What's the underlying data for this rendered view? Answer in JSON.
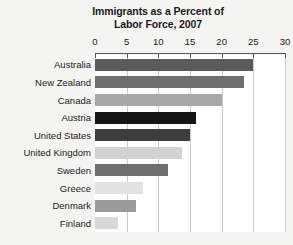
{
  "chart_data": {
    "type": "bar",
    "orientation": "horizontal",
    "title": "Immigrants as a Percent of Labor Force, 2007",
    "title_line1": "Immigrants as a Percent of",
    "title_line2": "Labor Force, 2007",
    "xlabel": "",
    "ylabel": "",
    "xlim": [
      0,
      30
    ],
    "xticks": [
      0,
      5,
      10,
      15,
      20,
      25,
      30
    ],
    "xtick_labels": [
      "0",
      "5",
      "10",
      "15",
      "20",
      "25",
      "30"
    ],
    "grid": "vertical",
    "legend": "none",
    "categories": [
      "Australia",
      "New Zealand",
      "Canada",
      "Austria",
      "United States",
      "United Kingdom",
      "Sweden",
      "Greece",
      "Denmark",
      "Finland"
    ],
    "values": [
      25.0,
      23.5,
      20.0,
      16.0,
      15.0,
      13.7,
      11.5,
      7.5,
      6.4,
      3.6
    ],
    "bar_colors": [
      "#5b5b5b",
      "#6e6e6e",
      "#a8a8a8",
      "#161616",
      "#3d3d3d",
      "#d2d2d2",
      "#6e6e6e",
      "#e2e2e2",
      "#9b9b9b",
      "#d8d8d8"
    ]
  },
  "style": {
    "page_background": "#f4f4f2",
    "plot_background": "#ffffff",
    "gridline_color": "#c9c9c9",
    "axis_color": "#555555",
    "text_color": "#1a1a1a"
  }
}
